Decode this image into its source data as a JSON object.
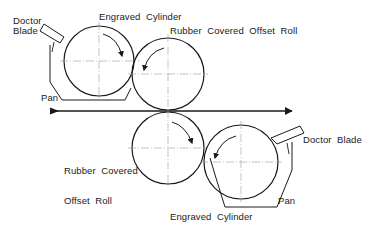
{
  "diagram": {
    "labels": {
      "top_doctor_blade_line1": "Doctor",
      "top_doctor_blade_line2": "Blade",
      "top_engraved_cylinder": "Engraved  Cylinder",
      "top_offset_roll": "Rubber  Covered  Offset  Roll",
      "top_pan": "Pan",
      "bottom_offset_roll_line1": "Rubber  Covered",
      "bottom_offset_roll_line2": "Offset  Roll",
      "bottom_doctor_blade": "Doctor  Blade",
      "bottom_pan": "Pan",
      "bottom_engraved_cylinder": "Engraved  Cylinder"
    },
    "components": [
      {
        "id": "top-engraved-cylinder",
        "type": "cylinder",
        "rotation": "clockwise"
      },
      {
        "id": "top-offset-roll",
        "type": "roll",
        "rotation": "counterclockwise"
      },
      {
        "id": "bottom-offset-roll",
        "type": "roll",
        "rotation": "clockwise"
      },
      {
        "id": "bottom-engraved-cylinder",
        "type": "cylinder",
        "rotation": "counterclockwise"
      },
      {
        "id": "web",
        "type": "arrow",
        "direction": "left-to-right"
      }
    ],
    "colors": {
      "stroke": "#1a1a1a",
      "centerline": "#9a9a9a",
      "background": "#ffffff"
    }
  }
}
